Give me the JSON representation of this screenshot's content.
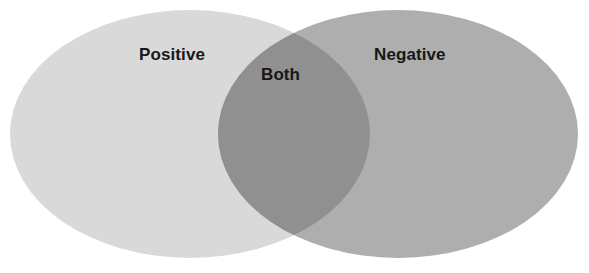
{
  "diagram": {
    "type": "venn-2-set",
    "title": "",
    "background_color": "#ffffff",
    "canvas": {
      "width": 589,
      "height": 273
    },
    "sets": [
      {
        "id": "left",
        "label": "Positive",
        "fill_color": "#d9d9d9",
        "shape": "ellipse",
        "cx": 190,
        "cy": 134,
        "rx": 180,
        "ry": 124
      },
      {
        "id": "right",
        "label": "Negative",
        "fill_color": "#aeaeae",
        "shape": "ellipse",
        "cx": 398,
        "cy": 134,
        "rx": 180,
        "ry": 124
      }
    ],
    "intersection": {
      "id": "overlap",
      "label": "Both",
      "fill_color": "#909090",
      "left_bound_x": 218,
      "right_bound_x": 370,
      "top_vertex_y": 28,
      "bottom_vertex_y": 240
    },
    "labels": {
      "positive": "Positive",
      "both": "Both",
      "negative": "Negative"
    },
    "label_color": "#171717"
  }
}
